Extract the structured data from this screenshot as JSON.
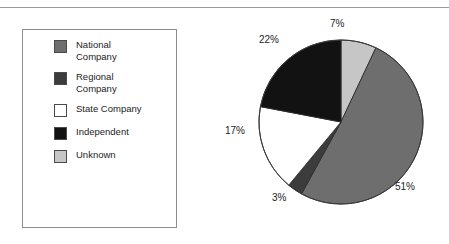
{
  "chart_data": {
    "type": "pie",
    "title": "",
    "categories": [
      "Unknown",
      "National Company",
      "Regional Company",
      "State Company",
      "Independent"
    ],
    "values": [
      7,
      51,
      3,
      17,
      22
    ],
    "value_labels": [
      "7%",
      "51%",
      "3%",
      "17%",
      "22%"
    ],
    "colors": [
      "#c6c6c6",
      "#6e6e6e",
      "#3c3c3c",
      "#ffffff",
      "#121212"
    ],
    "start_angle_deg": 0,
    "direction": "clockwise",
    "legend_position": "left",
    "grid": false
  },
  "legend": {
    "items": [
      {
        "label": "National\nCompany",
        "color": "#6e6e6e"
      },
      {
        "label": "Regional\nCompany",
        "color": "#3c3c3c"
      },
      {
        "label": "State Company",
        "color": "#ffffff"
      },
      {
        "label": "Independent",
        "color": "#121212"
      },
      {
        "label": "Unknown",
        "color": "#c6c6c6"
      }
    ]
  },
  "pie_labels": {
    "unknown": "7%",
    "national": "51%",
    "regional": "3%",
    "state": "17%",
    "independent": "22%"
  }
}
